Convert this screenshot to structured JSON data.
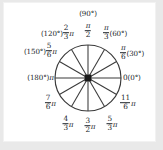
{
  "figure": {
    "type": "unit-circle-diagram",
    "title": "",
    "colors": {
      "page_background": "#e9e9e9",
      "card_background": "#ffffff",
      "stroke": "#3a3a3a",
      "text": "#22262b"
    },
    "circle": {
      "center_x": 88,
      "center_y": 78,
      "radius": 33,
      "spoke_count": 12,
      "spoke_step_degrees": 30,
      "center_dot": "filled-square"
    },
    "labels": [
      {
        "id": "deg-90",
        "degrees": 90,
        "degree_text": "(90°)",
        "num": "",
        "den": "",
        "pi": "",
        "position": "above-top"
      },
      {
        "id": "rad-90",
        "degrees": 90,
        "degree_text": "",
        "num": "π",
        "den": "2",
        "pi": "",
        "position": "top"
      },
      {
        "id": "rad-60",
        "degrees": 60,
        "degree_text": "(60°)",
        "num": "π",
        "den": "3",
        "pi": "",
        "position": "upper-right"
      },
      {
        "id": "rad-30",
        "degrees": 30,
        "degree_text": "(30°)",
        "num": "π",
        "den": "6",
        "pi": "",
        "position": "right-upper"
      },
      {
        "id": "rad-0",
        "degrees": 0,
        "degree_text": "(0°)",
        "num": "",
        "den": "",
        "pi": "0",
        "position": "right"
      },
      {
        "id": "rad-330",
        "degrees": 330,
        "degree_text": "",
        "num": "11",
        "den": "6",
        "pi": "π",
        "position": "right-lower"
      },
      {
        "id": "rad-300",
        "degrees": 300,
        "degree_text": "",
        "num": "5",
        "den": "3",
        "pi": "π",
        "position": "lower-right"
      },
      {
        "id": "rad-270",
        "degrees": 270,
        "degree_text": "",
        "num": "3",
        "den": "2",
        "pi": "π",
        "position": "bottom"
      },
      {
        "id": "rad-240",
        "degrees": 240,
        "degree_text": "",
        "num": "4",
        "den": "3",
        "pi": "π",
        "position": "lower-left"
      },
      {
        "id": "rad-210",
        "degrees": 210,
        "degree_text": "",
        "num": "7",
        "den": "6",
        "pi": "π",
        "position": "left-lower"
      },
      {
        "id": "rad-180",
        "degrees": 180,
        "degree_text": "(180°)",
        "num": "",
        "den": "",
        "pi": "π",
        "position": "left"
      },
      {
        "id": "rad-150",
        "degrees": 150,
        "degree_text": "(150°)",
        "num": "5",
        "den": "6",
        "pi": "π",
        "position": "left-upper"
      },
      {
        "id": "rad-120",
        "degrees": 120,
        "degree_text": "(120°)",
        "num": "2",
        "den": "3",
        "pi": "π",
        "position": "upper-left"
      }
    ],
    "text": {
      "deg90": "(90°)",
      "deg60": "(60°)",
      "deg30": "(30°)",
      "deg0": "(0°)",
      "deg180": "(180°)",
      "deg150": "(150°)",
      "deg120": "(120°)",
      "zero": "0",
      "pi": "π",
      "n_pi": "π",
      "n11": "11",
      "n7": "7",
      "n5": "5",
      "n4": "4",
      "n3": "3",
      "n2": "2",
      "d2": "2",
      "d3": "3",
      "d6": "6"
    }
  }
}
